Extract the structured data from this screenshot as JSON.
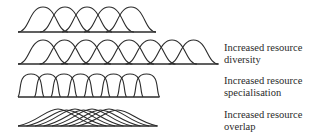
{
  "diagram": {
    "stroke_color": "#2b2b2b",
    "rows": [
      {
        "id": "baseline-distribution",
        "label_lines": [],
        "curve_count": 5,
        "description": "Reference resource-use curves, moderate width and overlap"
      },
      {
        "id": "resource-diversity",
        "label_lines": [
          "Increased resource",
          "diversity"
        ],
        "curve_count": 8,
        "description": "More curves spanning a wider resource axis"
      },
      {
        "id": "resource-specialisation",
        "label_lines": [
          "Increased resource",
          "specialisation"
        ],
        "curve_count": 8,
        "description": "Narrower, taller curves with less overlap"
      },
      {
        "id": "resource-overlap",
        "label_lines": [
          "Increased resource",
          "overlap"
        ],
        "curve_count": 8,
        "description": "Flattened, widely overlapping curves"
      }
    ]
  }
}
